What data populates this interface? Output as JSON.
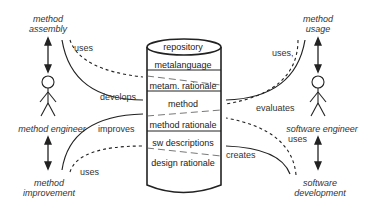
{
  "actors": {
    "method_engineer": "method engineer",
    "software_engineer": "software engineer"
  },
  "activities": {
    "method_assembly": [
      "method",
      "assembly"
    ],
    "method_improvement": [
      "method",
      "improvement"
    ],
    "method_usage": [
      "method",
      "usage"
    ],
    "software_development": [
      "software",
      "development"
    ]
  },
  "relations": {
    "assembly_uses": "uses",
    "develops": "develops",
    "improves": "improves",
    "improvement_uses": "uses",
    "usage_uses": "uses,",
    "evaluates": "evaluates",
    "development_uses": "uses",
    "creates": "creates"
  },
  "repository": {
    "title": "repository",
    "layers": [
      "metalanguage",
      "metam. rationale",
      "method",
      "method rationale",
      "sw descriptions",
      "design rationale"
    ]
  },
  "colors": {
    "line": "#222222",
    "text": "#333333",
    "background": "#ffffff"
  }
}
